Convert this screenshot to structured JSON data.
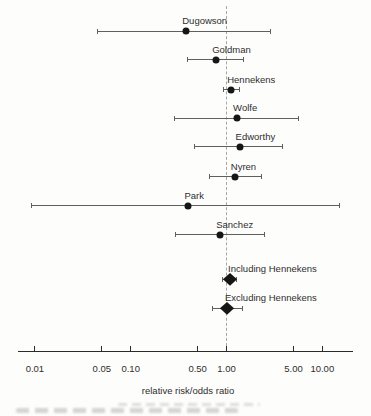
{
  "colors": {
    "marker": "#161616",
    "ci_line": "#5f5f5f",
    "reference_line": "#a6a6a6",
    "axis": "#2b2b2b",
    "text": "#2e2e2e"
  },
  "chart_data": {
    "type": "forest",
    "x_scale": "log10",
    "xlabel": "relative risk/odds ratio",
    "x_range": [
      0.007,
      20
    ],
    "x_ticks": [
      0.01,
      0.05,
      0.1,
      0.5,
      1.0,
      5.0,
      10.0
    ],
    "x_tick_labels": [
      "0.01",
      "0.05",
      "0.10",
      "0.50",
      "1.00",
      "5.00",
      "10.00"
    ],
    "reference_line": 1.0,
    "grid": false,
    "legend": false,
    "studies": [
      {
        "label": "Dugowson",
        "estimate": 0.38,
        "ci_low": 0.045,
        "ci_high": 2.9,
        "marker": "circle"
      },
      {
        "label": "Goldman",
        "estimate": 0.78,
        "ci_low": 0.39,
        "ci_high": 1.51,
        "marker": "circle"
      },
      {
        "label": "Hennekens",
        "estimate": 1.12,
        "ci_low": 0.93,
        "ci_high": 1.37,
        "marker": "circle"
      },
      {
        "label": "Wolfe",
        "estimate": 1.29,
        "ci_low": 0.28,
        "ci_high": 5.7,
        "marker": "circle"
      },
      {
        "label": "Edworthy",
        "estimate": 1.37,
        "ci_low": 0.46,
        "ci_high": 3.9,
        "marker": "circle"
      },
      {
        "label": "Nyren",
        "estimate": 1.22,
        "ci_low": 0.66,
        "ci_high": 2.36,
        "marker": "circle"
      },
      {
        "label": "Park",
        "estimate": 0.4,
        "ci_low": 0.009,
        "ci_high": 15.2,
        "marker": "circle"
      },
      {
        "label": "Sanchez",
        "estimate": 0.86,
        "ci_low": 0.29,
        "ci_high": 2.5,
        "marker": "circle"
      },
      {
        "label": "Including Hennekens",
        "estimate": 1.09,
        "ci_low": 0.9,
        "ci_high": 1.3,
        "marker": "diamond"
      },
      {
        "label": "Excluding Hennekens",
        "estimate": 1.01,
        "ci_low": 0.71,
        "ci_high": 1.49,
        "marker": "diamond"
      }
    ]
  }
}
